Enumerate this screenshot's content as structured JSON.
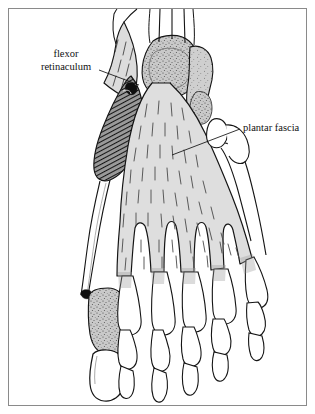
{
  "figure": {
    "kind": "anatomical-illustration",
    "view": "plantar (inferior) view",
    "border_color": "#8a8a8a",
    "background_color": "#ffffff",
    "ink_color": "#111111"
  },
  "labels": [
    {
      "id": "flexor-retinaculum",
      "lines": [
        "flexor",
        "retinaculum"
      ],
      "line1": "flexor",
      "line2": "retinaculum",
      "text_anchor_x": 66,
      "text_anchor_y": 57,
      "leader_from_x": 99,
      "leader_from_y": 70,
      "leader_to_x": 139,
      "leader_to_y": 85
    },
    {
      "id": "plantar-fascia",
      "lines": [
        "plantar fascia"
      ],
      "line1": "plantar fascia",
      "text_anchor_x": 243,
      "text_anchor_y": 131,
      "leader_from_x": 240,
      "leader_from_y": 129,
      "leader_to_x": 172,
      "leader_to_y": 155
    }
  ],
  "structures": [
    {
      "name": "flexor retinaculum",
      "tone": "#d8d8d8",
      "note": "cut flap with dashed fibre striations, upper left"
    },
    {
      "name": "abductor hallucis muscle",
      "tone": "#4a4a4a",
      "note": "diagonally hatched dark muscle belly, medial side"
    },
    {
      "name": "plantar fascia (plantar aponeurosis)",
      "tone": "#dcdcdc",
      "note": "central triangular sheet with longitudinal dashed fibres splitting into five digital slips"
    },
    {
      "name": "calcaneus",
      "tone": "#c8c8c8",
      "note": "stippled bone, proximal"
    },
    {
      "name": "cuboid and lateral tarsals",
      "tone": "#c4c4c4",
      "note": "stippled bone, lateral"
    },
    {
      "name": "first metatarsal",
      "tone": "#c0c0c0",
      "note": "stippled shaft at the hallux"
    },
    {
      "name": "fifth metatarsal",
      "tone": "#ffffff",
      "note": "outlined bone with tuberosity on the lateral border"
    },
    {
      "name": "flexor tendons",
      "tone": "#ffffff",
      "note": "three slender tendon lines leaving the top edge"
    },
    {
      "name": "phalanges of toes two to five",
      "tone": "#ffffff",
      "note": "proximal, middle and distal phalanges outlined"
    },
    {
      "name": "phalanges of the hallux",
      "tone": "#ffffff",
      "note": "broad distal phalanx of the great toe"
    }
  ],
  "counts": {
    "digital_slips": 5,
    "tendon_lines_top": 3,
    "toes": 5
  }
}
